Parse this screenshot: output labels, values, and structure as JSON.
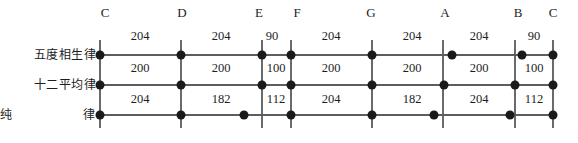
{
  "diagram": {
    "note_letters": [
      "C",
      "D",
      "E",
      "F",
      "G",
      "A",
      "B",
      "C"
    ],
    "rows": [
      {
        "label": "五度相生律",
        "values": [
          "204",
          "204",
          "90",
          "204",
          "204",
          "204",
          "90"
        ]
      },
      {
        "label": "十二平均律",
        "values": [
          "200",
          "200",
          "100",
          "200",
          "200",
          "200",
          "100"
        ]
      },
      {
        "label": "纯　　　律",
        "label_plain": "纯 律",
        "values": [
          "204",
          "182",
          "112",
          "204",
          "182",
          "204",
          "112"
        ]
      }
    ],
    "colors": {
      "line": "#5d5d5d",
      "divider": "#6a6a6a",
      "dot": "#1a1a1a",
      "text": "#1d1d1d",
      "background": "#ffffff"
    },
    "geometry": {
      "divider_x": [
        100,
        181,
        262,
        291,
        372,
        443,
        515,
        553
      ],
      "row_y": [
        55,
        85,
        115
      ],
      "dot_x": [
        [
          100,
          181,
          262,
          291,
          372,
          443,
          522,
          553
        ],
        [
          100,
          181,
          262,
          291,
          372,
          443,
          515,
          553
        ],
        [
          100,
          181,
          244,
          291,
          372,
          434,
          510,
          553
        ]
      ],
      "value_label_y": [
        36,
        68,
        99
      ],
      "value_label_x": [
        [
          140,
          221,
          272,
          331,
          412,
          479,
          534
        ],
        [
          140,
          221,
          272,
          331,
          412,
          479,
          534
        ],
        [
          140,
          221,
          272,
          331,
          412,
          479,
          534
        ]
      ]
    }
  }
}
